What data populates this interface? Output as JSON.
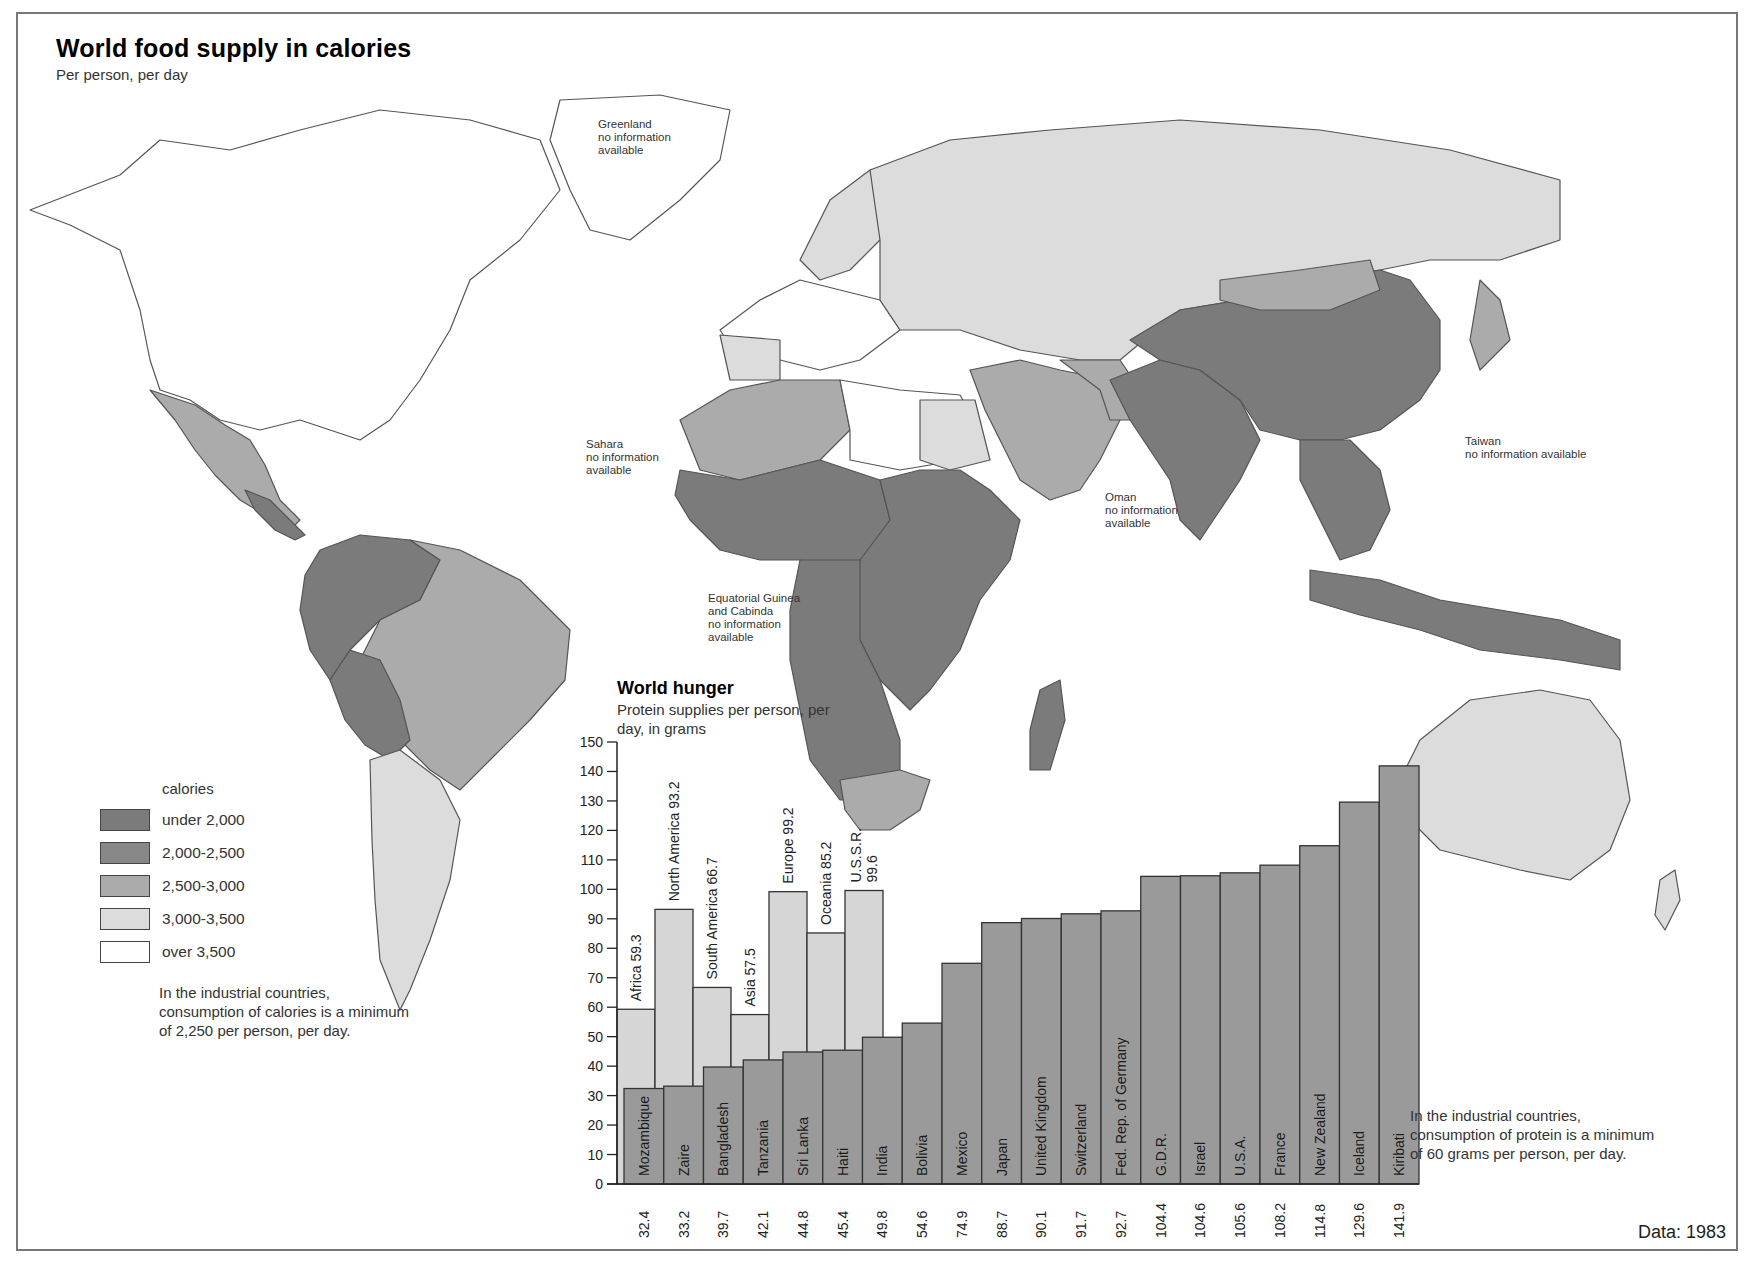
{
  "header": {
    "title": "World food supply in  calories",
    "subtitle": "Per person, per day"
  },
  "map": {
    "colors": {
      "under_2000": "#7b7b7b",
      "2000_2500": "#898989",
      "2500_3000": "#ababab",
      "3000_3500": "#d9d9d9",
      "over_3500": "#ffffff"
    },
    "notes": [
      {
        "id": "greenland",
        "text": "Greenland\nno information\navailable"
      },
      {
        "id": "sahara",
        "text": "Sahara\nno information\navailable"
      },
      {
        "id": "oman",
        "text": "Oman\nno information\navailable"
      },
      {
        "id": "taiwan",
        "text": "Taiwan\nno information available"
      },
      {
        "id": "eq-guinea",
        "text": "Equatorial Guinea\nand Cabinda\nno information\navailable"
      }
    ]
  },
  "legend": {
    "title": "calories",
    "items": [
      {
        "label": "under 2,000",
        "color": "#7b7b7b"
      },
      {
        "label": "2,000-2,500",
        "color": "#878787"
      },
      {
        "label": "2,500-3,000",
        "color": "#ababab"
      },
      {
        "label": "3,000-3,500",
        "color": "#dcdcdc"
      },
      {
        "label": "over 3,500",
        "color": "#ffffff"
      }
    ],
    "note": "In the industrial countries, consumption of calories is a minimum of 2,250 per person, per day."
  },
  "hunger": {
    "title": "World hunger",
    "subtitle": "Protein supplies per person, per day, in grams",
    "note": "In the industrial countries, consumption of protein is a minimum of 60 grams per person, per day."
  },
  "footer": {
    "data_year": "Data: 1983"
  },
  "chart_data": {
    "type": "bar",
    "title": "World hunger",
    "subtitle": "Protein supplies per person, per day, in grams",
    "xlabel": "",
    "ylabel": "grams of protein per person per day",
    "ylim": [
      0,
      150
    ],
    "yticks": [
      0,
      10,
      20,
      30,
      40,
      50,
      60,
      70,
      80,
      90,
      100,
      110,
      120,
      130,
      140,
      150
    ],
    "grid": false,
    "series": [
      {
        "name": "Regions",
        "color": "#d6d6d6",
        "categories": [
          "Africa",
          "North America",
          "South America",
          "Asia",
          "Europe",
          "Oceania",
          "U.S.S.R."
        ],
        "values": [
          59.3,
          93.2,
          66.7,
          57.5,
          99.2,
          85.2,
          99.6
        ],
        "labels": [
          "Africa 59.3",
          "North America 93.2",
          "South America 66.7",
          "Asia 57.5",
          "Europe 99.2",
          "Oceania 85.2",
          "U.S.S.R. 99.6"
        ]
      },
      {
        "name": "Countries",
        "color": "#9a9a9a",
        "categories": [
          "Mozambique",
          "Zaire",
          "Bangladesh",
          "Tanzania",
          "Sri Lanka",
          "Haiti",
          "India",
          "Bolivia",
          "Mexico",
          "Japan",
          "United Kingdom",
          "Switzerland",
          "Fed. Rep. of Germany",
          "G.D.R.",
          "Israel",
          "U.S.A.",
          "France",
          "New Zealand",
          "Iceland",
          "Kiribati"
        ],
        "values": [
          32.4,
          33.2,
          39.7,
          42.1,
          44.8,
          45.4,
          49.8,
          54.6,
          74.9,
          88.7,
          90.1,
          91.7,
          92.7,
          104.4,
          104.6,
          105.6,
          108.2,
          114.8,
          129.6,
          141.9
        ],
        "value_labels": [
          "32.4",
          "33.2",
          "39.7",
          "42.1",
          "44.8",
          "45.4",
          "49.8",
          "54.6",
          "74.9",
          "88.7",
          "90.1",
          "91.7",
          "92.7",
          "104.4",
          "104.6",
          "105.6",
          "108.2",
          "114.8",
          "129.6",
          "141.9"
        ]
      }
    ]
  }
}
